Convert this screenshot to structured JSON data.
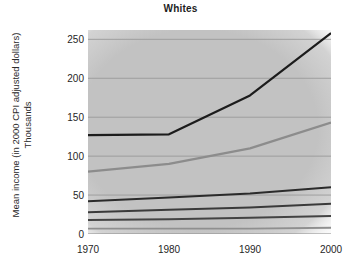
{
  "chart_data": {
    "type": "line",
    "title": "Whites",
    "xlabel": "",
    "ylabel": "Mean income (in 2000 CPI adjusted dollars)",
    "ylabel_line2": "Thousands",
    "x": [
      1970,
      1980,
      1990,
      2000
    ],
    "xticks": [
      "1970",
      "1980",
      "1990",
      "2000"
    ],
    "yticks": [
      0,
      50,
      100,
      150,
      200,
      250
    ],
    "ytick_labels": [
      "0",
      "50",
      "100",
      "150",
      "200",
      "250"
    ],
    "xlim": [
      1970,
      2000
    ],
    "ylim": [
      0,
      262
    ],
    "grid": true,
    "legend": "none",
    "plot_background": "#c3c3c3",
    "series": [
      {
        "name": "top-5-percent",
        "color": "#1c1c1c",
        "width": 2.2,
        "values": [
          127,
          128,
          178,
          258
        ]
      },
      {
        "name": "highest-quintile",
        "color": "#8c8c8c",
        "width": 2.2,
        "values": [
          80,
          90,
          110,
          143
        ]
      },
      {
        "name": "fourth-quintile",
        "color": "#2b2b2b",
        "width": 2.0,
        "values": [
          42,
          47,
          52,
          60
        ]
      },
      {
        "name": "third-quintile",
        "color": "#3a3a3a",
        "width": 2.0,
        "values": [
          28,
          31,
          34,
          39
        ]
      },
      {
        "name": "second-quintile",
        "color": "#434343",
        "width": 2.0,
        "values": [
          18,
          19,
          21,
          23
        ]
      },
      {
        "name": "lowest-quintile",
        "color": "#8f8f8f",
        "width": 1.8,
        "values": [
          7,
          7,
          7,
          8
        ]
      }
    ]
  }
}
